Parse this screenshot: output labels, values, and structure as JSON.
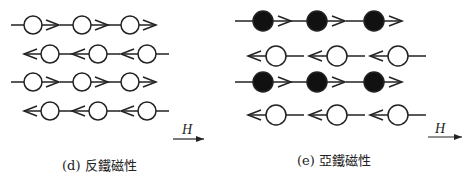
{
  "panels": [
    {
      "id": "d",
      "caption": "(d) 反鐵磁性",
      "field_label": "H",
      "rows": [
        {
          "direction": "right",
          "filled": false,
          "count": 3
        },
        {
          "direction": "left",
          "filled": false,
          "count": 3
        },
        {
          "direction": "right",
          "filled": false,
          "count": 3
        },
        {
          "direction": "left",
          "filled": false,
          "count": 3
        }
      ]
    },
    {
      "id": "e",
      "caption": "(e) 亞鐵磁性",
      "field_label": "H",
      "rows": [
        {
          "direction": "right",
          "filled": true,
          "count": 3
        },
        {
          "direction": "left",
          "filled": false,
          "count": 3
        },
        {
          "direction": "right",
          "filled": true,
          "count": 3
        },
        {
          "direction": "left",
          "filled": false,
          "count": 3
        }
      ]
    }
  ],
  "colors": {
    "stroke": "#222222",
    "fill_dark": "#111111",
    "background": "#ffffff"
  }
}
